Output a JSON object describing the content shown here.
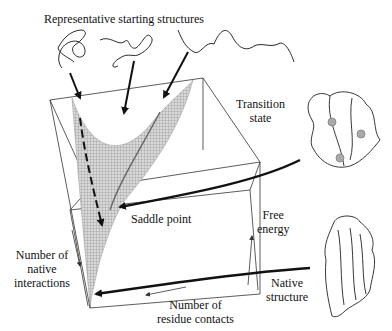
{
  "figure": {
    "labels": {
      "starting_structures": "Representative starting structures",
      "transition_state_line1": "Transition",
      "transition_state_line2": "state",
      "saddle_point": "Saddle point",
      "free_energy_line1": "Free",
      "free_energy_line2": "energy",
      "native_interactions_line1": "Number of",
      "native_interactions_line2": "native",
      "native_interactions_line3": "interactions",
      "residue_contacts_line1": "Number of",
      "residue_contacts_line2": "residue contacts",
      "native_structure_line1": "Native",
      "native_structure_line2": "structure"
    },
    "axes": {
      "vertical": "Free energy",
      "left_depth": "Number of native interactions",
      "bottom": "Number of residue contacts"
    },
    "colors": {
      "line": "#111111",
      "surface": "#9a9a9a",
      "box": "#333333"
    }
  }
}
